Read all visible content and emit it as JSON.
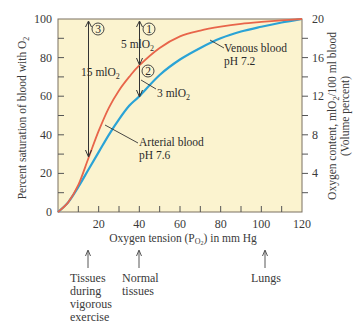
{
  "chart_data": {
    "type": "line",
    "title": "",
    "xlabel": "Oxygen tension (P_O2) in mm Hg",
    "ylabel": "Percent saturation of blood with O2",
    "y2label": "Oxygen content, mlO2/100 ml blood (Volume percent)",
    "xlim": [
      0,
      120
    ],
    "ylim": [
      0,
      100
    ],
    "y2lim": [
      0,
      20
    ],
    "xticks": [
      20,
      40,
      60,
      80,
      100,
      120
    ],
    "xtick_minor_step": 10,
    "yticks": [
      0,
      20,
      40,
      60,
      80,
      100
    ],
    "y2ticks": [
      4,
      8,
      12,
      16,
      20
    ],
    "grid": false,
    "background": "#fbf3cf",
    "series": [
      {
        "name": "Arterial blood pH 7.6",
        "color": "#e8654a",
        "x": [
          0,
          5,
          10,
          15,
          20,
          25,
          30,
          35,
          40,
          50,
          60,
          70,
          80,
          90,
          100,
          110,
          120
        ],
        "values": [
          0,
          5,
          14,
          28,
          42,
          54,
          63,
          70,
          76,
          85,
          91,
          94,
          96,
          97.5,
          98.5,
          99.3,
          100
        ]
      },
      {
        "name": "Venous blood pH 7.2",
        "color": "#2aa3d6",
        "x": [
          0,
          5,
          10,
          15,
          20,
          25,
          30,
          35,
          40,
          50,
          60,
          70,
          80,
          90,
          100,
          110,
          120
        ],
        "values": [
          0,
          5,
          13,
          22,
          31,
          40,
          48,
          55,
          60,
          71,
          79,
          85,
          90,
          93.5,
          96,
          98.2,
          100
        ]
      }
    ],
    "annotations": [
      {
        "label": "1",
        "type": "circled-number",
        "x": 40,
        "y": 100
      },
      {
        "label": "2",
        "type": "circled-number",
        "x": 40,
        "y": 76
      },
      {
        "label": "3",
        "type": "circled-number",
        "x": 15,
        "y": 100
      },
      {
        "label": "5 mlO2",
        "type": "arrow",
        "x": 40,
        "from": 100,
        "to": 76
      },
      {
        "label": "3 mlO2",
        "type": "arrow",
        "x": 40,
        "from": 76,
        "to": 60
      },
      {
        "label": "15 mlO2",
        "type": "arrow",
        "x": 15,
        "from": 100,
        "to": 28
      },
      {
        "label": "Arterial blood pH 7.6",
        "type": "leader",
        "x": 23,
        "y": 48
      },
      {
        "label": "Venous blood pH 7.2",
        "type": "leader",
        "x": 75,
        "y": 88
      }
    ],
    "below_axis_markers": [
      {
        "x": 15,
        "label": "Tissues during vigorous exercise"
      },
      {
        "x": 40,
        "label": "Normal tissues"
      },
      {
        "x": 100,
        "label": "Lungs"
      }
    ]
  },
  "labels": {
    "ylabel_main": "Percent saturation of blood with O",
    "ylabel_sub": "2",
    "y2label_line1_a": "Oxygen content, mlO",
    "y2label_line1_sub": "2",
    "y2label_line1_b": "/100 ml blood",
    "y2label_line2": "(Volume percent)",
    "xlabel_a": "Oxygen tension (P",
    "xlabel_sub": "O",
    "xlabel_subsub": "2",
    "xlabel_b": ") in mm Hg",
    "circle_1": "1",
    "circle_2": "2",
    "circle_3": "3",
    "anno_5": "5 mlO",
    "anno_3": "3 mlO",
    "anno_15": "15 mlO",
    "sub2": "2",
    "arterial_1": "Arterial blood",
    "arterial_2": "pH 7.6",
    "venous_1": "Venous blood",
    "venous_2": "pH 7.2",
    "marker_exercise": "Tissues\nduring\nvigorous\nexercise",
    "marker_normal": "Normal\ntissues",
    "marker_lungs": "Lungs"
  }
}
